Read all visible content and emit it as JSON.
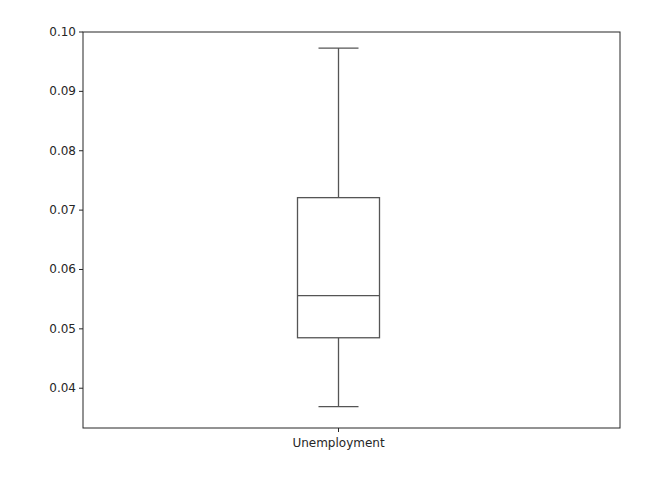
{
  "chart_data": {
    "type": "box",
    "title": "",
    "xlabel": "",
    "ylabel": "",
    "categories": [
      "Unemployment"
    ],
    "series": [
      {
        "name": "Unemployment",
        "whisker_low": 0.0369,
        "q1": 0.0485,
        "median": 0.0556,
        "q3": 0.0721,
        "whisker_high": 0.0973
      }
    ],
    "ylim": [
      0.0333,
      0.1
    ],
    "yticks": [
      0.04,
      0.05,
      0.06,
      0.07,
      0.08,
      0.09,
      0.1
    ],
    "ytick_labels": [
      "0.04",
      "0.05",
      "0.06",
      "0.07",
      "0.08",
      "0.09",
      "0.10"
    ],
    "grid": false,
    "legend": null
  },
  "style": {
    "axis_color": "#262626",
    "box_color": "#555555",
    "background": "#ffffff"
  }
}
